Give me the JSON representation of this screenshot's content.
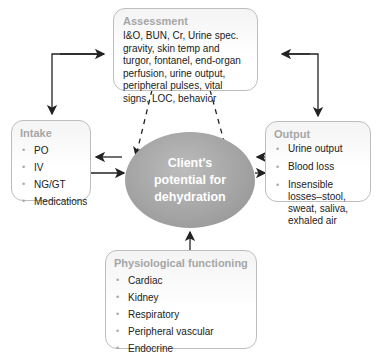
{
  "diagram": {
    "center": {
      "label": "Client's potential for dehydration"
    },
    "assessment": {
      "title": "Assessment",
      "body": "I&O, BUN, Cr, Urine spec. gravity, skin temp and turgor, fontanel, end-organ perfusion, urine output, peripheral pulses, vital signs, LOC, behavior"
    },
    "intake": {
      "title": "Intake",
      "items": [
        "PO",
        "IV",
        "NG/GT",
        "Medications"
      ]
    },
    "output": {
      "title": "Output",
      "items": [
        "Urine output",
        "Blood loss",
        "Insensible losses–stool, sweat, saliva, exhaled air"
      ]
    },
    "physiological": {
      "title": "Physiological functioning",
      "items": [
        "Cardiac",
        "Kidney",
        "Respiratory",
        "Peripheral vascular",
        "Endocrine"
      ]
    },
    "connections": [
      {
        "from": "assessment",
        "to": "intake",
        "style": "solid",
        "bidirectional": true
      },
      {
        "from": "assessment",
        "to": "output",
        "style": "solid",
        "bidirectional": true
      },
      {
        "from": "assessment",
        "to": "center",
        "style": "dashed",
        "count": 2
      },
      {
        "from": "intake",
        "to": "center",
        "style": "solid",
        "bidirectional": true
      },
      {
        "from": "output",
        "to": "center",
        "style": "solid",
        "bidirectional": true
      },
      {
        "from": "physiological",
        "to": "center",
        "style": "solid"
      }
    ]
  }
}
